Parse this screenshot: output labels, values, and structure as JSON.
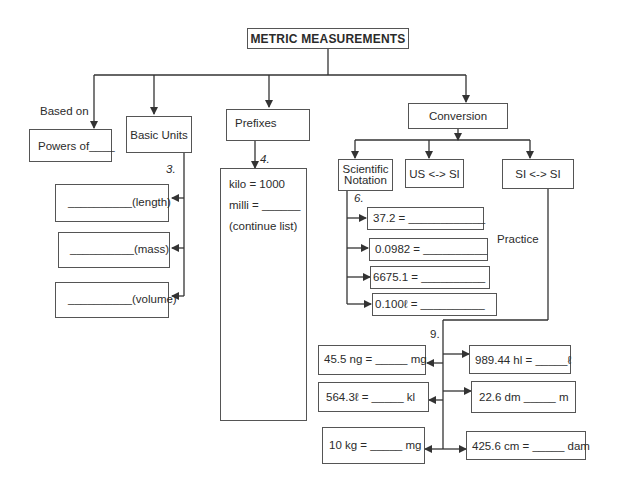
{
  "title": "METRIC MEASUREMENTS",
  "branches": {
    "based_on": {
      "label": "Based on",
      "box": "Powers of____"
    },
    "basic_units": {
      "label": "Basic Units",
      "number": "3.",
      "items": [
        "__________(length)",
        "__________(mass)",
        "__________(volume)"
      ]
    },
    "prefixes": {
      "label": "Prefixes",
      "number": "4.",
      "lines": [
        "kilo = 1000",
        "milli = ______",
        "(continue list)"
      ]
    },
    "conversion": {
      "label": "Conversion",
      "children": {
        "scientific_notation": {
          "label_line1": "Scientific",
          "label_line2": "Notation",
          "number": "6.",
          "items": [
            "37.2 = ____________",
            "0.0982 = __________",
            "6675.1 =  __________",
            "0.100ℓ =  __________"
          ]
        },
        "us_si": {
          "label": "US <-> SI"
        },
        "si_si": {
          "label": "SI <-> SI",
          "number": "9.",
          "left_items": [
            "45.5 ng = _____  mg",
            "564.3ℓ =  _____  kl",
            "10 kg =  _____  mg"
          ],
          "right_items": [
            "989.44 hl = _____ℓ",
            "22.6 dm _____  m",
            "425.6 cm = _____ dam"
          ]
        }
      }
    }
  },
  "practice_label": "Practice"
}
